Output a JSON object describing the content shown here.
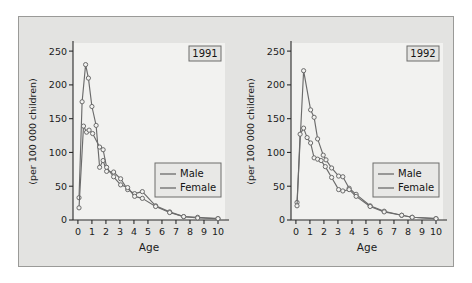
{
  "figure": {
    "background_color": "#ffffff",
    "panel_background_color": "#e3e3e1",
    "panel_border_color": "#9a9a98",
    "plot_background_color": "#f2f2f0"
  },
  "chart_data": [
    {
      "type": "line",
      "panel": "left",
      "title": "1991",
      "xlabel": "Age",
      "ylabel": "(per 100 000 children)",
      "xlim": [
        -0.35,
        10.5
      ],
      "ylim": [
        0,
        262
      ],
      "xticks": [
        0,
        1,
        2,
        3,
        4,
        5,
        6,
        7,
        8,
        9,
        10
      ],
      "xticklabels": [
        "0",
        "1",
        "2",
        "3",
        "4",
        "5",
        "6",
        "7",
        "8",
        "9",
        "10"
      ],
      "yticks": [
        0,
        50,
        100,
        150,
        200,
        250
      ],
      "yticklabels": [
        "0",
        "50",
        "100",
        "150",
        "200",
        "250"
      ],
      "grid": false,
      "legend_position": "right-middle",
      "marker": "circle",
      "series": [
        {
          "name": "Male",
          "color": "#6b6b6b",
          "x": [
            0.08,
            0.3,
            0.55,
            0.75,
            1.0,
            1.3,
            1.55,
            1.8,
            2.05,
            2.55,
            3.05,
            3.55,
            4.05,
            4.6,
            5.55,
            6.55,
            7.55,
            8.55,
            10.0
          ],
          "values": [
            33,
            175,
            230,
            210,
            168,
            140,
            78,
            88,
            72,
            71,
            61,
            45,
            39,
            42,
            21,
            12,
            5,
            4,
            2
          ]
        },
        {
          "name": "Female",
          "color": "#6b6b6b",
          "x": [
            0.08,
            0.4,
            0.62,
            0.8,
            1.05,
            1.55,
            1.8,
            2.05,
            2.55,
            3.05,
            3.55,
            4.05,
            4.6,
            5.55,
            6.55,
            7.55,
            8.55,
            10.0
          ],
          "values": [
            18,
            139,
            130,
            133,
            128,
            108,
            104,
            78,
            64,
            52,
            48,
            35,
            32,
            20,
            11,
            5,
            3,
            2
          ]
        }
      ]
    },
    {
      "type": "line",
      "panel": "right",
      "title": "1992",
      "xlabel": "Age",
      "ylabel": "(per 100 000 children)",
      "xlim": [
        -0.35,
        10.5
      ],
      "ylim": [
        0,
        262
      ],
      "xticks": [
        0,
        1,
        2,
        3,
        4,
        5,
        6,
        7,
        8,
        9,
        10
      ],
      "xticklabels": [
        "0",
        "1",
        "2",
        "3",
        "4",
        "5",
        "6",
        "7",
        "8",
        "9",
        "10"
      ],
      "yticks": [
        0,
        50,
        100,
        150,
        200,
        250
      ],
      "yticklabels": [
        "0",
        "50",
        "100",
        "150",
        "200",
        "250"
      ],
      "grid": false,
      "legend_position": "right-middle",
      "marker": "circle",
      "series": [
        {
          "name": "Male",
          "color": "#6b6b6b",
          "x": [
            0.08,
            0.55,
            1.05,
            1.3,
            1.55,
            1.95,
            2.15,
            2.55,
            3.05,
            3.35,
            3.8,
            4.3,
            5.3,
            6.3,
            7.55,
            8.3,
            10.0
          ],
          "values": [
            26,
            221,
            163,
            152,
            120,
            96,
            89,
            77,
            65,
            64,
            47,
            38,
            21,
            13,
            7,
            4,
            2
          ]
        },
        {
          "name": "Female",
          "color": "#6b6b6b",
          "x": [
            0.08,
            0.3,
            0.55,
            0.8,
            1.05,
            1.3,
            1.55,
            1.8,
            2.1,
            2.55,
            3.05,
            3.35,
            3.8,
            4.3,
            5.3,
            6.3,
            7.55,
            8.3,
            10.0
          ],
          "values": [
            21,
            127,
            136,
            122,
            114,
            92,
            90,
            88,
            79,
            63,
            45,
            43,
            45,
            35,
            20,
            12,
            7,
            4,
            2
          ]
        }
      ]
    }
  ]
}
